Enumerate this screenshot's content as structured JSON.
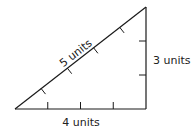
{
  "diagram": {
    "shape": "right triangle",
    "stroke_color": "#1a1a1a",
    "sides": {
      "hypotenuse": {
        "label": "5 units",
        "length": 5
      },
      "vertical": {
        "label": "3 units",
        "length": 3
      },
      "base": {
        "label": "4 units",
        "length": 4
      }
    }
  }
}
